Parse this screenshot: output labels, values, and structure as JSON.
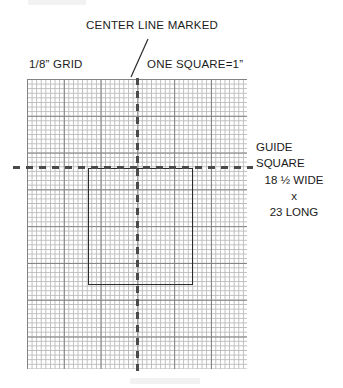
{
  "figure": {
    "title_note": "CENTER LINE MARKED",
    "grid_scale_label": "1/8” GRID",
    "one_square_label": "ONE SQUARE=1”",
    "callout": {
      "line1": "GUIDE",
      "line2": "SQUARE",
      "line3": "18 ½ WIDE",
      "line4": "x",
      "line5": "23 LONG"
    },
    "colors": {
      "minor_grid": "#b9b9b9",
      "major_grid": "#7d7d7d",
      "center_line": "#4a4a4a",
      "guide_square_outline": "#2b2b2b",
      "text": "#1c1c1c",
      "background": "#ffffff"
    },
    "geometry": {
      "grid_cell_px": "4.6",
      "major_every_cells": "8",
      "guide_square_width_in": "18.5",
      "guide_square_length_in": "23",
      "units": "inches"
    }
  }
}
